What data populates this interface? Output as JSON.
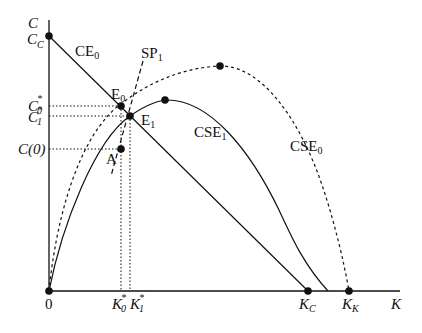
{
  "axes": {
    "y_label": "C",
    "x_label": "K",
    "origin_label": "0"
  },
  "y_ticks": {
    "cc": {
      "main": "C",
      "sub": "C"
    },
    "c0_star": {
      "main": "C",
      "sub": "0",
      "sup": "*"
    },
    "c1_star": {
      "main": "C",
      "sub": "1",
      "sup": "*"
    },
    "c_zero": "C(0)"
  },
  "x_ticks": {
    "k0_star": {
      "main": "K",
      "sub": "0",
      "sup": "*"
    },
    "k1_star": {
      "main": "K",
      "sub": "1",
      "sup": "*"
    },
    "kc": {
      "main": "K",
      "sub": "C"
    },
    "kk": {
      "main": "K",
      "sub": "K"
    }
  },
  "curves": {
    "ce0": {
      "main": "CE",
      "sub": "0"
    },
    "sp1": {
      "main": "SP",
      "sub": "1"
    },
    "cse1": {
      "main": "CSE",
      "sub": "1"
    },
    "cse0": {
      "main": "CSE",
      "sub": "0"
    }
  },
  "points": {
    "e0": {
      "main": "E",
      "sub": "0"
    },
    "e1": {
      "main": "E",
      "sub": "1"
    },
    "a": {
      "main": "A",
      "sub": ""
    }
  },
  "colors": {
    "stroke": "#111111",
    "background": "#ffffff"
  }
}
